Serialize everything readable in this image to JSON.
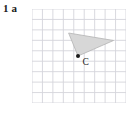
{
  "page": {
    "width": 135,
    "height": 115,
    "background": "#ffffff"
  },
  "label": {
    "question_number": "1",
    "part_letter": "a",
    "full_text": "1 a",
    "color": "#1a1a1a"
  },
  "figure": {
    "name": "grid-with-shaded-dart-shape",
    "grid": {
      "columns": 9,
      "rows": 9,
      "cell_size": 10.45,
      "line_color": "#d5d5db",
      "line_width": 0.9,
      "border_color": "#d5d5db",
      "origin_x": 0,
      "origin_y": 0,
      "width": 94,
      "height": 94
    },
    "shape": {
      "type": "polygon",
      "fill": "#d7d7d7",
      "stroke": "#b4b4b4",
      "stroke_width": 0.8,
      "points_grid": [
        [
          3.5,
          2.3
        ],
        [
          4.4,
          4.5
        ],
        [
          7.8,
          3.0
        ],
        [
          4.4,
          4.5
        ]
      ],
      "points_px": [
        [
          36.6,
          24.0
        ],
        [
          46.0,
          47.0
        ],
        [
          81.5,
          31.5
        ],
        [
          46.0,
          47.0
        ]
      ],
      "path_px": "M 36.6 24.0 L 46.0 47.0 L 81.5 31.5 Z"
    },
    "point": {
      "label": "C",
      "marker": "filled-dot",
      "marker_color": "#1a1a1a",
      "marker_radius": 2.0,
      "x_px": 46.0,
      "y_px": 47.0,
      "label_color": "#1a1a1a",
      "label_x_px": 50.5,
      "label_y_px": 55.5
    }
  }
}
